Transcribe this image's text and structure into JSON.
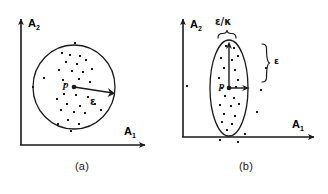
{
  "figure": {
    "title": "",
    "caption_a": "(a)",
    "caption_b": "(b)",
    "ink_color": "#1a1a1a",
    "background_color": "#ffffff"
  },
  "axes": {
    "y_label": "A",
    "y_sub": "2",
    "x_label": "A",
    "x_sub": "1"
  },
  "panel_a": {
    "center_label": "p",
    "radius_label": "ε",
    "shape": "circle",
    "center": [
      74,
      87
    ],
    "radius": 40,
    "points": [
      [
        74,
        87
      ],
      [
        75,
        44
      ],
      [
        62,
        53
      ],
      [
        70,
        55
      ],
      [
        80,
        56
      ],
      [
        66,
        62
      ],
      [
        77,
        64
      ],
      [
        86,
        60
      ],
      [
        59,
        70
      ],
      [
        72,
        71
      ],
      [
        83,
        72
      ],
      [
        92,
        69
      ],
      [
        63,
        80
      ],
      [
        79,
        79
      ],
      [
        90,
        82
      ],
      [
        44,
        78
      ],
      [
        41,
        87
      ],
      [
        64,
        94
      ],
      [
        76,
        95
      ],
      [
        57,
        99
      ],
      [
        88,
        97
      ],
      [
        67,
        104
      ],
      [
        80,
        106
      ],
      [
        95,
        104
      ],
      [
        61,
        110
      ],
      [
        74,
        112
      ],
      [
        85,
        113
      ],
      [
        68,
        120
      ],
      [
        58,
        124
      ],
      [
        79,
        124
      ],
      [
        100,
        110
      ],
      [
        71,
        131
      ]
    ]
  },
  "panel_b": {
    "center_label": "p",
    "minor_label": "ε/κ",
    "major_label": "ε",
    "shape": "ellipse",
    "center": [
      65,
      88
    ],
    "rx": 18,
    "ry": 48,
    "points": [
      [
        65,
        88
      ],
      [
        62,
        46
      ],
      [
        70,
        48
      ],
      [
        57,
        58
      ],
      [
        68,
        60
      ],
      [
        74,
        56
      ],
      [
        60,
        68
      ],
      [
        71,
        70
      ],
      [
        55,
        78
      ],
      [
        66,
        76
      ],
      [
        74,
        80
      ],
      [
        58,
        88
      ],
      [
        72,
        87
      ],
      [
        61,
        96
      ],
      [
        70,
        98
      ],
      [
        56,
        105
      ],
      [
        67,
        106
      ],
      [
        75,
        104
      ],
      [
        60,
        114
      ],
      [
        71,
        116
      ],
      [
        58,
        122
      ],
      [
        68,
        124
      ],
      [
        63,
        130
      ],
      [
        22,
        86
      ],
      [
        96,
        90
      ],
      [
        101,
        68
      ],
      [
        92,
        112
      ],
      [
        56,
        140
      ],
      [
        73,
        142
      ],
      [
        79,
        134
      ]
    ]
  }
}
